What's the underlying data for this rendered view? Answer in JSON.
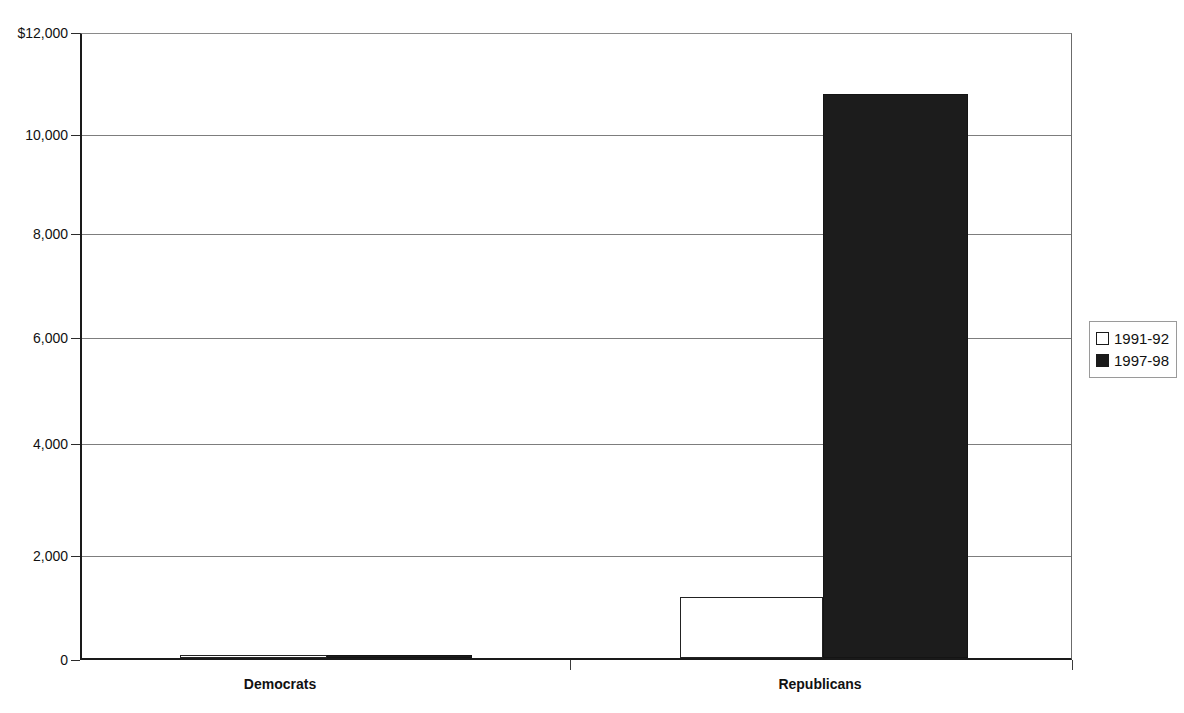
{
  "chart_data": {
    "type": "bar",
    "title": "",
    "subtitle": "",
    "xlabel": "",
    "ylabel": "",
    "categories": [
      "Democrats",
      "Republicans"
    ],
    "series": [
      {
        "name": "1991-92",
        "values": [
          0,
          1170
        ],
        "style": "hollow",
        "color": "#ffffff"
      },
      {
        "name": "1997-98",
        "values": [
          10,
          10850
        ],
        "style": "filled",
        "color": "#1c1c1c"
      }
    ],
    "ylim": [
      0,
      12000
    ],
    "y_ticks": [
      0,
      2000,
      4000,
      6000,
      8000,
      10000,
      12000
    ],
    "y_tick_labels": [
      "0",
      "2,000",
      "4,000",
      "6,000",
      "8,000",
      "10,000",
      "$12,000"
    ],
    "grid": true,
    "legend_position": "right",
    "value_prefix": "$"
  },
  "axes": {
    "y": {
      "ticks": [
        {
          "label": "$12,000",
          "value": 12000
        },
        {
          "label": "10,000",
          "value": 10000
        },
        {
          "label": "8,000",
          "value": 8000
        },
        {
          "label": "6,000",
          "value": 6000
        },
        {
          "label": "4,000",
          "value": 4000
        },
        {
          "label": "2,000",
          "value": 2000
        },
        {
          "label": "0",
          "value": 0
        }
      ]
    },
    "x": {
      "categories": [
        {
          "label": "Democrats"
        },
        {
          "label": "Republicans"
        }
      ]
    }
  },
  "legend": {
    "entries": [
      {
        "label": "1991-92",
        "swatch": "hollow-square-swatch"
      },
      {
        "label": "1997-98",
        "swatch": "filled-square-swatch"
      }
    ]
  }
}
